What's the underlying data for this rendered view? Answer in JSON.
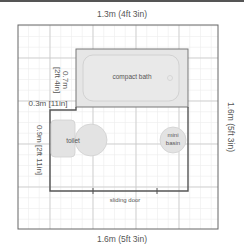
{
  "plan": {
    "dimensions": {
      "top_width": "1.3m  (4ft 3in)",
      "bottom_width": "1.6m  (5ft 3in)",
      "right_height": "1.6m  (5ft 3in)",
      "left_upper_depth_line1": "0.7m",
      "left_upper_depth_line2": "[2ft 4in]",
      "left_step": "0.3m [11in]",
      "left_lower_height": "0.9m  [2ft 11in]"
    },
    "fixtures": {
      "bath": "compact bath",
      "toilet": "toilet",
      "basin_line1": "mini",
      "basin_line2": "basin",
      "door": "sliding door"
    },
    "colors": {
      "wall": "#555555",
      "grid_major": "#c8c8c8",
      "grid_minor": "#ececec",
      "fixture_fill": "#e6e6e6",
      "fixture_stroke": "#cfcfcf",
      "label": "#555555"
    }
  }
}
